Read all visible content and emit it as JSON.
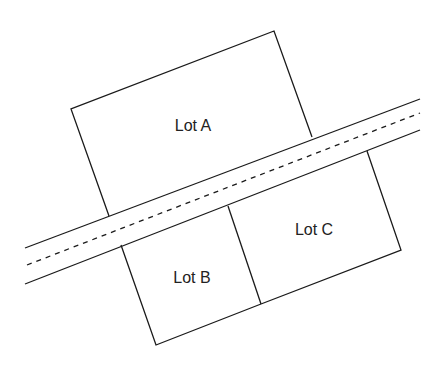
{
  "diagram": {
    "lots": [
      {
        "label": "Lot A"
      },
      {
        "label": "Lot B"
      },
      {
        "label": "Lot C"
      }
    ],
    "road": {
      "centerline": "dashed"
    },
    "colors": {
      "line": "#1a1a1a",
      "background": "#ffffff",
      "text": "#222222"
    }
  }
}
